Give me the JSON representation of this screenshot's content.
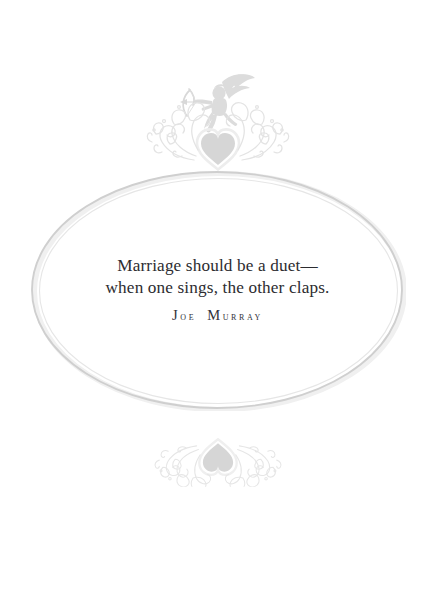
{
  "page": {
    "background_color": "#ffffff",
    "width": 435,
    "height": 590
  },
  "quote": {
    "line1": "Marriage should be a duet—",
    "line2": "when one sings, the other claps.",
    "text_color": "#2c2c30"
  },
  "attribution": {
    "full_name": "Joe Murray",
    "first_initial": "J",
    "first_rest": "oe",
    "last_initial": "M",
    "last_rest": "urray",
    "text_color": "#32323a"
  },
  "ornament_top": {
    "name": "cupid-heart-flourish-ornament",
    "has_cupid": true,
    "has_heart": true,
    "has_scrollwork": true,
    "heart_fill": "#d6d6d6",
    "scroll_color": "#e3e3e3",
    "cupid_fill": "#dcdcdc"
  },
  "ornament_bottom": {
    "name": "heart-flourish-ornament",
    "has_cupid": false,
    "has_heart": true,
    "has_scrollwork": true,
    "heart_fill": "#d6d6d6",
    "scroll_color": "#e6e6e6"
  },
  "oval_frame": {
    "name": "decorative-oval-border",
    "stroke_outer": "#e0e0e0",
    "stroke_inner": "#cfcfcf",
    "shadow": "#f0f0f0"
  }
}
